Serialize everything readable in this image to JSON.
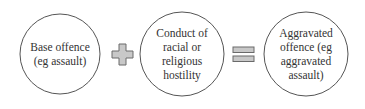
{
  "diagram": {
    "nodes": [
      {
        "id": "base",
        "label_lines": [
          "Base offence",
          "(eg assault)"
        ]
      },
      {
        "id": "conduct",
        "label_lines": [
          "Conduct of",
          "racial or",
          "religious",
          "hostility"
        ]
      },
      {
        "id": "aggravated",
        "label_lines": [
          "Aggravated",
          "offence (eg",
          "aggravated",
          "assault)"
        ]
      }
    ],
    "operators": [
      {
        "symbol": "plus",
        "between": [
          "base",
          "conduct"
        ]
      },
      {
        "symbol": "equals",
        "between": [
          "conduct",
          "aggravated"
        ]
      }
    ],
    "colors": {
      "circle_stroke": "#555555",
      "operator_fill": "#c8c8c8",
      "operator_stroke": "#6a6a6a",
      "text": "#333333"
    }
  }
}
